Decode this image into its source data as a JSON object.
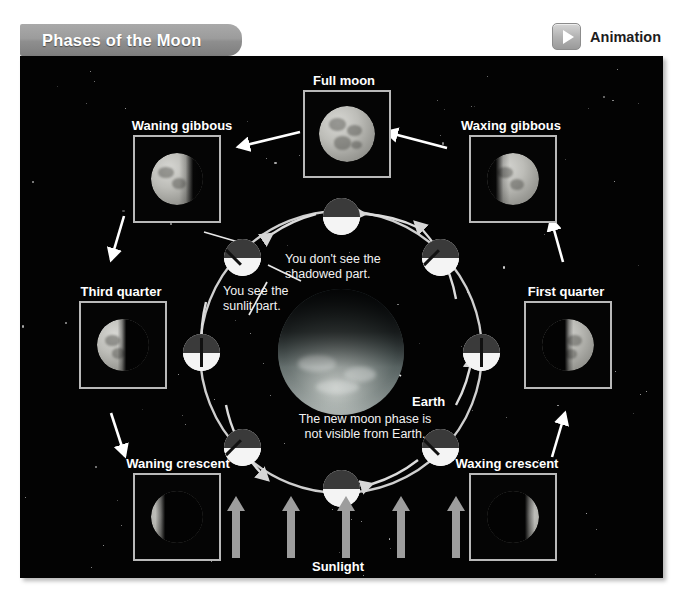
{
  "header": {
    "title": "Phases of the Moon",
    "animation_label": "Animation",
    "play_icon": "play-icon"
  },
  "diagram": {
    "background_color": "#030303",
    "frame_border_color": "#b9b9b9",
    "orbit_color": "#cfcfcf",
    "arrow_color": "#ffffff",
    "sunlight_arrow_color": "#9d9d9d",
    "title_tab_color": "#9c9c9c",
    "phases": [
      {
        "id": "full-moon",
        "label": "Full moon",
        "lit_side": "full"
      },
      {
        "id": "waning-gibbous",
        "label": "Waning gibbous",
        "lit_side": "left"
      },
      {
        "id": "waxing-gibbous",
        "label": "Waxing gibbous",
        "lit_side": "right"
      },
      {
        "id": "third-quarter",
        "label": "Third quarter",
        "lit_side": "left"
      },
      {
        "id": "first-quarter",
        "label": "First quarter",
        "lit_side": "right"
      },
      {
        "id": "waning-crescent",
        "label": "Waning crescent",
        "lit_side": "left"
      },
      {
        "id": "waxing-crescent",
        "label": "Waxing crescent",
        "lit_side": "right"
      }
    ],
    "callouts": [
      {
        "id": "moons-orbit",
        "text": "Moon's\norbit"
      },
      {
        "id": "shadowed-part",
        "text": "You don't see the\nshadowed part."
      },
      {
        "id": "sunlit-part",
        "text": "You see the\nsunlit part."
      },
      {
        "id": "new-moon-note",
        "text": "The new moon phase is\nnot visible from Earth."
      }
    ],
    "earth_label": "Earth",
    "sunlight_label": "Sunlight",
    "orbit_positions": 8,
    "sunlight_arrow_count": 5
  }
}
